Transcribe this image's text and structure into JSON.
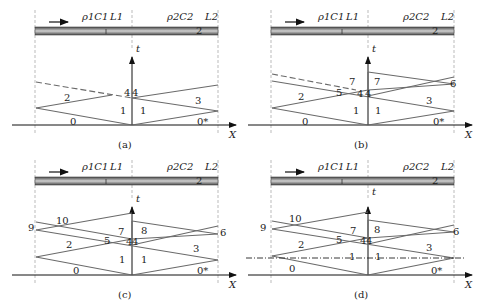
{
  "figure": {
    "panels": [
      {
        "id": "a",
        "caption": "(a)",
        "bar": {
          "material1": "ρ1C1",
          "length1": "L1",
          "material2": "ρ2C2",
          "length2": "L2",
          "marker1": "1",
          "marker2": "2"
        },
        "axes": {
          "t": "t",
          "x": "X"
        },
        "regions": [
          "0",
          "0*",
          "1",
          "1",
          "2",
          "3",
          "4",
          "4"
        ]
      },
      {
        "id": "b",
        "caption": "(b)",
        "bar": {
          "material1": "ρ1C1",
          "length1": "L1",
          "material2": "ρ2C2",
          "length2": "L2",
          "marker1": "1",
          "marker2": "2"
        },
        "axes": {
          "t": "t",
          "x": "X"
        },
        "regions": [
          "0",
          "0*",
          "1",
          "1",
          "2",
          "3",
          "4",
          "4",
          "5",
          "6",
          "7",
          "7"
        ]
      },
      {
        "id": "c",
        "caption": "(c)",
        "bar": {
          "material1": "ρ1C1",
          "length1": "L1",
          "material2": "ρ2C2",
          "length2": "L2",
          "marker1": "1",
          "marker2": "2"
        },
        "axes": {
          "t": "t",
          "x": "X"
        },
        "regions": [
          "0",
          "0*",
          "1",
          "1",
          "2",
          "3",
          "4",
          "4",
          "5",
          "6",
          "7",
          "8",
          "9",
          "10"
        ]
      },
      {
        "id": "d",
        "caption": "(d)",
        "bar": {
          "material1": "ρ1C1",
          "length1": "L1",
          "material2": "ρ2C2",
          "length2": "L2",
          "marker1": "1",
          "marker2": "2"
        },
        "axes": {
          "t": "t",
          "x": "X"
        },
        "regions": [
          "0",
          "0*",
          "1",
          "1",
          "2",
          "3",
          "4",
          "4",
          "5",
          "6",
          "7",
          "8",
          "9",
          "10"
        ]
      }
    ],
    "colors": {
      "wave_line": "#6a6a6a",
      "axis": "#111111",
      "bar_dark": "#555555",
      "bar_light": "#c8c8c8",
      "guide": "#999999"
    }
  }
}
